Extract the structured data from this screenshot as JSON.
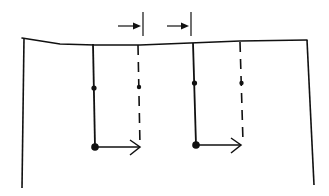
{
  "diagram": {
    "type": "hand-drawn sketch",
    "colors": {
      "ink": "#111111",
      "background": "#ffffff"
    },
    "frame": {
      "beam": [
        [
          22,
          38
        ],
        [
          60,
          44
        ],
        [
          95,
          45
        ],
        [
          140,
          45
        ],
        [
          190,
          43
        ],
        [
          240,
          41
        ],
        [
          307,
          40
        ]
      ],
      "left_wall": [
        [
          24,
          38
        ],
        [
          22,
          188
        ]
      ],
      "right_wall": [
        [
          307,
          40
        ],
        [
          314,
          185
        ]
      ]
    },
    "pendulums": [
      {
        "solid": {
          "x_top": 93,
          "y_top": 44,
          "x_bottom": 95,
          "y_bottom": 147,
          "mid_dot_y": 88
        },
        "dashed": {
          "x_top": 138,
          "y_top": 45,
          "x_bottom": 140,
          "y_bottom": 146,
          "mid_dot_y": 87
        },
        "arrow": {
          "x1": 95,
          "y1": 147,
          "x2": 140,
          "y2": 147
        }
      },
      {
        "solid": {
          "x_top": 193,
          "y_top": 43,
          "x_bottom": 196,
          "y_bottom": 145,
          "mid_dot_y": 83
        },
        "dashed": {
          "x_top": 240,
          "y_top": 42,
          "x_bottom": 243,
          "y_bottom": 142,
          "mid_dot_y": 83
        },
        "arrow": {
          "x1": 196,
          "y1": 145,
          "x2": 241,
          "y2": 145
        }
      }
    ],
    "top_markers": [
      {
        "tick_x": 143,
        "tick_y1": 12,
        "tick_y2": 36,
        "arrow_x1": 118,
        "arrow_x2": 141,
        "arrow_y": 26
      },
      {
        "tick_x": 191,
        "tick_y1": 12,
        "tick_y2": 36,
        "arrow_x1": 167,
        "arrow_x2": 189,
        "arrow_y": 26
      }
    ]
  }
}
